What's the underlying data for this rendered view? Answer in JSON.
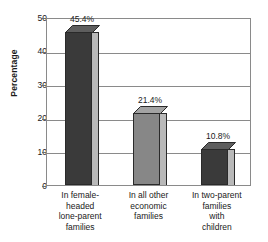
{
  "chart_data": {
    "type": "bar",
    "title": "",
    "xlabel": "",
    "ylabel": "Percentage",
    "ylim": [
      0,
      50
    ],
    "yticks": [
      0,
      10,
      20,
      30,
      40,
      50
    ],
    "ytick_labels": [
      "0",
      "10",
      "20",
      "30",
      "40",
      "50"
    ],
    "grid": true,
    "legend": "none",
    "categories": [
      "In female-headed lone-parent families",
      "In all other economic families",
      "In two-parent families with children"
    ],
    "category_lines": [
      [
        "In female-",
        "headed",
        "lone-parent",
        "families"
      ],
      [
        "In all other",
        "economic",
        "families"
      ],
      [
        "In two-parent",
        "families",
        "with",
        "children"
      ]
    ],
    "values": [
      45.4,
      21.4,
      10.8
    ],
    "value_labels": [
      "45.4%",
      "21.4%",
      "10.8%"
    ],
    "bar_colors": [
      "#3a3a3a",
      "#878787",
      "#3a3a3a"
    ],
    "bar_side_colors": [
      "#b9b9b9",
      "#b9b9b9",
      "#b9b9b9"
    ],
    "bar_top_colors": [
      "#5e5e5e",
      "#a3a3a3",
      "#5e5e5e"
    ],
    "axis_color": "#8a8a8a",
    "text_color": "#1a1a1a",
    "background": "#ffffff"
  },
  "axis": {
    "y_title": "Percentage"
  }
}
